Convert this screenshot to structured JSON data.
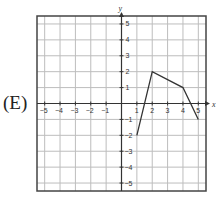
{
  "problem": {
    "option_label": "(E)"
  },
  "chart_data": {
    "type": "line",
    "title": "",
    "xlabel": "x",
    "ylabel": "y",
    "xlim": [
      -5.5,
      5.5
    ],
    "ylim": [
      -5.5,
      5.5
    ],
    "grid": true,
    "x_ticks": [
      -5,
      -4,
      -3,
      -2,
      -1,
      1,
      2,
      3,
      4,
      5
    ],
    "y_ticks": [
      -5,
      -4,
      -3,
      -2,
      -1,
      1,
      2,
      3,
      4,
      5
    ],
    "series": [
      {
        "name": "piecewise linear function",
        "x": [
          1,
          2,
          4,
          5
        ],
        "y": [
          -2,
          2,
          1,
          -1
        ]
      }
    ]
  }
}
